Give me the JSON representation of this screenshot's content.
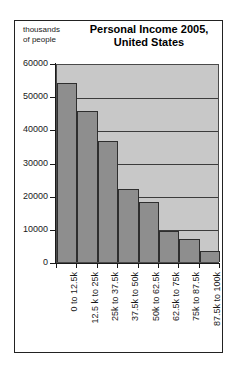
{
  "chart_data": {
    "type": "bar",
    "title": "Personal Income 2005, United States",
    "title_lines": [
      "Personal Income 2005,",
      "United States"
    ],
    "ylabel": "thousands of people",
    "ylabel_lines": [
      "thousands",
      "of people"
    ],
    "xlabel": "",
    "categories": [
      "0 to 12.5k",
      "12.5 k to 25k",
      "25k to 37.5k",
      "37.5k to 50k",
      "50k to 62.5k",
      "62.5k to 75k",
      "75k to 87.5k",
      "87.5k to 100k"
    ],
    "values": [
      54000,
      45500,
      36500,
      22000,
      18000,
      9500,
      6800,
      3400
    ],
    "ylim": [
      0,
      60000
    ],
    "yticks": [
      0,
      10000,
      20000,
      30000,
      40000,
      50000,
      60000
    ],
    "ytick_labels": [
      "0",
      "10000",
      "20000",
      "30000",
      "40000",
      "50000",
      "60000"
    ],
    "grid": true,
    "legend": false,
    "colors": {
      "bar": "#8e8e8e",
      "bar_edge": "#2e2e2e",
      "plot_background": "#c8c8c8",
      "gridline": "#3c3c3c",
      "axis": "#1a1a1a",
      "text": "#1a1a1a",
      "page_background": "#ffffff",
      "frame": "#222222"
    }
  }
}
